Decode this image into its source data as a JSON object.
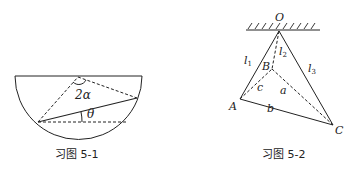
{
  "figures": [
    {
      "caption": "习图 5-1",
      "labels": {
        "angle_apex": "2α",
        "angle_base": "θ"
      }
    },
    {
      "caption": "习图 5-2",
      "labels": {
        "O": "O",
        "A": "A",
        "B": "B",
        "C": "C",
        "l1": "l",
        "l1_sub": "1",
        "l2": "l",
        "l2_sub": "2",
        "l3": "l",
        "l3_sub": "3",
        "a": "a",
        "b": "b",
        "c": "c"
      }
    }
  ]
}
